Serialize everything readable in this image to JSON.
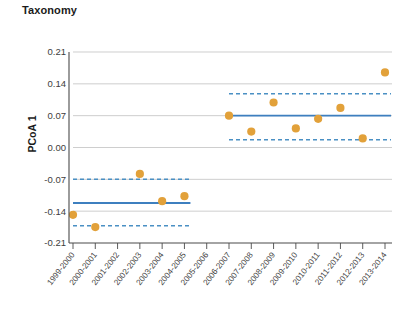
{
  "chart_data": {
    "type": "scatter",
    "title": "Taxonomy",
    "xlabel": "",
    "ylabel": "PCoA 1",
    "ylim": [
      -0.21,
      0.21
    ],
    "yticks": [
      "0.21",
      "0.14",
      "0.07",
      "0.00",
      "-0.07",
      "-0.14",
      "-0.21"
    ],
    "ytick_values": [
      0.21,
      0.14,
      0.07,
      0.0,
      -0.07,
      -0.14,
      -0.21
    ],
    "grid": "horizontal",
    "legend": "none",
    "categories": [
      "1999-2000",
      "2000-2001",
      "2001-2002",
      "2002-2003",
      "2003-2004",
      "2004-2005",
      "2005-2006",
      "2006-2007",
      "2007-2008",
      "2008-2009",
      "2009-2010",
      "2010-2011",
      "2011-2012",
      "2012-2013",
      "2013-2014"
    ],
    "points": [
      {
        "x": "1999-2000",
        "y": -0.148
      },
      {
        "x": "2000-2001",
        "y": -0.175
      },
      {
        "x": "2002-2003",
        "y": -0.058
      },
      {
        "x": "2003-2004",
        "y": -0.118
      },
      {
        "x": "2004-2005",
        "y": -0.107
      },
      {
        "x": "2006-2007",
        "y": 0.07
      },
      {
        "x": "2007-2008",
        "y": 0.035
      },
      {
        "x": "2008-2009",
        "y": 0.099
      },
      {
        "x": "2009-2010",
        "y": 0.042
      },
      {
        "x": "2010-2011",
        "y": 0.063
      },
      {
        "x": "2011-2012",
        "y": 0.087
      },
      {
        "x": "2012-2013",
        "y": 0.02
      },
      {
        "x": "2013-2014",
        "y": 0.165
      }
    ],
    "segments": [
      {
        "name": "early-period",
        "x_start": "1999-2000",
        "x_end": "2004-2005",
        "mean": -0.122,
        "ci_upper": -0.07,
        "ci_lower": -0.172
      },
      {
        "name": "late-period",
        "x_start": "2006-2007",
        "x_end": "2013-2014",
        "mean": 0.07,
        "ci_upper": 0.118,
        "ci_lower": 0.017
      }
    ],
    "colors": {
      "point": "#e2a13a",
      "mean_line": "#3d7fbf",
      "ci_line": "#4a90c4",
      "grid": "#b9b9b9",
      "axis": "#4a4a4a",
      "text": "#1b1b1b"
    }
  }
}
